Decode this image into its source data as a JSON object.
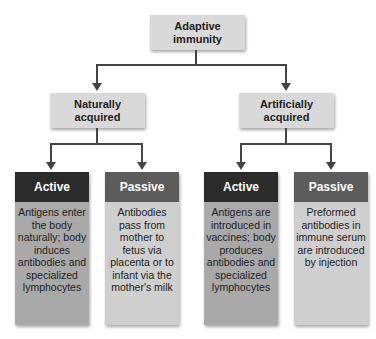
{
  "colors": {
    "root_box": "#d9d9d9",
    "connector": "#444444",
    "active_header": "#2b2b2b",
    "active_body": "#a9a9a9",
    "passive_header": "#5c5c5c",
    "passive_body": "#cfcfcf"
  },
  "root": {
    "label": "Adaptive immunity"
  },
  "branches": [
    {
      "label": "Naturally acquired",
      "children": [
        {
          "type": "Active",
          "text": "Antigens enter the body naturally; body induces antibodies and specialized lymphocytes"
        },
        {
          "type": "Passive",
          "text": "Antibodies pass from mother to fetus via placenta or to infant via the mother's milk"
        }
      ]
    },
    {
      "label": "Artificially acquired",
      "children": [
        {
          "type": "Active",
          "text": "Antigens are introduced in vaccines; body produces antibodies and specialized lymphocytes"
        },
        {
          "type": "Passive",
          "text": "Preformed antibodies in immune serum are introduced by injection"
        }
      ]
    }
  ]
}
